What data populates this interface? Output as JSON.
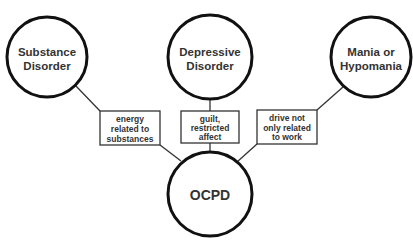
{
  "diagram": {
    "center_node": {
      "label": "OCPD"
    },
    "nodes": [
      {
        "id": "substance",
        "lines": [
          "Substance",
          "Disorder"
        ]
      },
      {
        "id": "depressive",
        "lines": [
          "Depressive",
          "Disorder"
        ]
      },
      {
        "id": "mania",
        "lines": [
          "Mania or",
          "Hypomania"
        ]
      }
    ],
    "edges": [
      {
        "from": "substance",
        "to": "OCPD",
        "lines": [
          "energy",
          "related to",
          "substances"
        ]
      },
      {
        "from": "depressive",
        "to": "OCPD",
        "lines": [
          "guilt,",
          "restricted",
          "affect"
        ]
      },
      {
        "from": "mania",
        "to": "OCPD",
        "lines": [
          "drive not",
          "only related",
          "to work"
        ]
      }
    ]
  }
}
